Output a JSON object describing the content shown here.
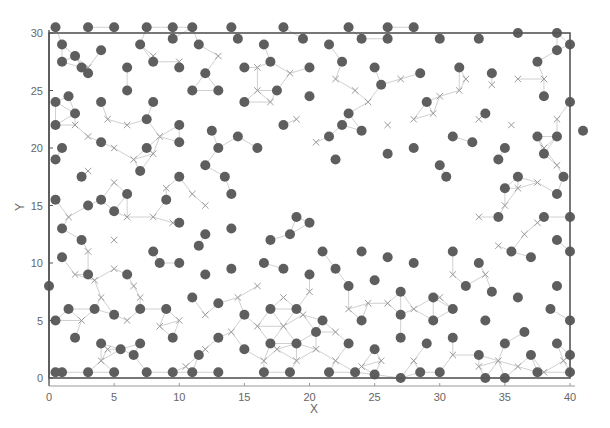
{
  "chart_data": {
    "type": "scatter",
    "title": "",
    "xlabel": "X",
    "ylabel": "Y",
    "xlim": [
      0,
      40
    ],
    "ylim": [
      0,
      30
    ],
    "xticks": [
      0,
      5,
      10,
      15,
      20,
      25,
      30,
      35,
      40
    ],
    "yticks": [
      0,
      5,
      10,
      15,
      20,
      25,
      30
    ],
    "grid": false,
    "legend": null,
    "colors": {
      "node": "#5e5e5e",
      "cross": "#9a9a9a",
      "edge": "#c4c4c4",
      "frame": "#555555",
      "text": "#666666"
    },
    "series": [
      {
        "name": "nodes (filled circles)",
        "marker": "circle",
        "points": [
          [
            0.5,
            30.5
          ],
          [
            3,
            30.5
          ],
          [
            5,
            30.5
          ],
          [
            7.5,
            30.5
          ],
          [
            9.5,
            30.5
          ],
          [
            11,
            30.5
          ],
          [
            14,
            30.5
          ],
          [
            18,
            30.5
          ],
          [
            23,
            30.5
          ],
          [
            26,
            30.5
          ],
          [
            28,
            30.5
          ],
          [
            1,
            29
          ],
          [
            4,
            28.5
          ],
          [
            7,
            29
          ],
          [
            9.5,
            29.5
          ],
          [
            11.5,
            29
          ],
          [
            14.5,
            29.5
          ],
          [
            16.5,
            29
          ],
          [
            19.5,
            29.5
          ],
          [
            21.5,
            29
          ],
          [
            24,
            29.5
          ],
          [
            26,
            29.5
          ],
          [
            30,
            29.5
          ],
          [
            33,
            29.5
          ],
          [
            36,
            30
          ],
          [
            39,
            30
          ],
          [
            40,
            29
          ],
          [
            1,
            27.5
          ],
          [
            2,
            28
          ],
          [
            2.5,
            27
          ],
          [
            3,
            26.5
          ],
          [
            6,
            27
          ],
          [
            8,
            27.5
          ],
          [
            10,
            27
          ],
          [
            12,
            26.5
          ],
          [
            15,
            27
          ],
          [
            17,
            27.5
          ],
          [
            20,
            27
          ],
          [
            22.5,
            27.5
          ],
          [
            25,
            27
          ],
          [
            28.5,
            26.5
          ],
          [
            31.5,
            27
          ],
          [
            34,
            26.5
          ],
          [
            37.5,
            27.5
          ],
          [
            39,
            28.5
          ],
          [
            0.5,
            24
          ],
          [
            1.5,
            24.5
          ],
          [
            4,
            24
          ],
          [
            6,
            25
          ],
          [
            8,
            24
          ],
          [
            11,
            25
          ],
          [
            13,
            25
          ],
          [
            15,
            24
          ],
          [
            17.5,
            25
          ],
          [
            20,
            24.5
          ],
          [
            23,
            23
          ],
          [
            25.5,
            25.5
          ],
          [
            29,
            24
          ],
          [
            33.5,
            23
          ],
          [
            38,
            24.5
          ],
          [
            40,
            24
          ],
          [
            2,
            23
          ],
          [
            7.5,
            22.5
          ],
          [
            10,
            22
          ],
          [
            12.5,
            21.5
          ],
          [
            14.5,
            21
          ],
          [
            18,
            22
          ],
          [
            21.5,
            21
          ],
          [
            22.5,
            22
          ],
          [
            24,
            21.5
          ],
          [
            28,
            20
          ],
          [
            31,
            21
          ],
          [
            32.5,
            20.5
          ],
          [
            35,
            20
          ],
          [
            37.5,
            21
          ],
          [
            39,
            21
          ],
          [
            41,
            21.5
          ],
          [
            0.5,
            22
          ],
          [
            1,
            20
          ],
          [
            4,
            20.5
          ],
          [
            7.5,
            20
          ],
          [
            10,
            20.5
          ],
          [
            13,
            20
          ],
          [
            16,
            20
          ],
          [
            22,
            19
          ],
          [
            26,
            19.5
          ],
          [
            30,
            18.5
          ],
          [
            34.5,
            19
          ],
          [
            38,
            19.5
          ],
          [
            0.5,
            19
          ],
          [
            2.5,
            17.5
          ],
          [
            7,
            18
          ],
          [
            10,
            17.5
          ],
          [
            12,
            18.5
          ],
          [
            13.5,
            17.5
          ],
          [
            30.5,
            17.5
          ],
          [
            36,
            17.5
          ],
          [
            39.5,
            17.5
          ],
          [
            4,
            15.5
          ],
          [
            6,
            16
          ],
          [
            9,
            15.5
          ],
          [
            14,
            16
          ],
          [
            35,
            16.5
          ],
          [
            39,
            16
          ],
          [
            0.5,
            15.5
          ],
          [
            3,
            15
          ],
          [
            5,
            14.5
          ],
          [
            10,
            13.5
          ],
          [
            12,
            12.5
          ],
          [
            14,
            13
          ],
          [
            34.5,
            14
          ],
          [
            38,
            14
          ],
          [
            40,
            14
          ],
          [
            1,
            13
          ],
          [
            2.5,
            12
          ],
          [
            8,
            11
          ],
          [
            11.5,
            11.5
          ],
          [
            17,
            12
          ],
          [
            18.5,
            12.5
          ],
          [
            19,
            14
          ],
          [
            20,
            13.5
          ],
          [
            21,
            11
          ],
          [
            22,
            9.5
          ],
          [
            24,
            11
          ],
          [
            26,
            10.5
          ],
          [
            28,
            10
          ],
          [
            31,
            11
          ],
          [
            33,
            10
          ],
          [
            35.5,
            11
          ],
          [
            37,
            10.5
          ],
          [
            39,
            12
          ],
          [
            40,
            11
          ],
          [
            1,
            10.5
          ],
          [
            3,
            9
          ],
          [
            6,
            9
          ],
          [
            8.5,
            10
          ],
          [
            10,
            10
          ],
          [
            12,
            9
          ],
          [
            14,
            9.5
          ],
          [
            16.5,
            10
          ],
          [
            18,
            9.5
          ],
          [
            20,
            9
          ],
          [
            23,
            8
          ],
          [
            25,
            8.5
          ],
          [
            27,
            7.5
          ],
          [
            29.5,
            7
          ],
          [
            32,
            8
          ],
          [
            34,
            7.5
          ],
          [
            36,
            7
          ],
          [
            39,
            8
          ],
          [
            0,
            8
          ],
          [
            1.5,
            6
          ],
          [
            3.5,
            6
          ],
          [
            5,
            5.5
          ],
          [
            7,
            6
          ],
          [
            9,
            6
          ],
          [
            11,
            7
          ],
          [
            13,
            6.5
          ],
          [
            15,
            5.5
          ],
          [
            17,
            6
          ],
          [
            19,
            6
          ],
          [
            21,
            5
          ],
          [
            24,
            5
          ],
          [
            27,
            5.5
          ],
          [
            29.5,
            5
          ],
          [
            31,
            6
          ],
          [
            33.5,
            5
          ],
          [
            36.5,
            4
          ],
          [
            38.5,
            6
          ],
          [
            40,
            5
          ],
          [
            0.5,
            5
          ],
          [
            2,
            3.5
          ],
          [
            4,
            3
          ],
          [
            5.5,
            2.5
          ],
          [
            6.5,
            2
          ],
          [
            7,
            3
          ],
          [
            9.5,
            3.5
          ],
          [
            11.5,
            2
          ],
          [
            13,
            3.5
          ],
          [
            15,
            2.5
          ],
          [
            17,
            3
          ],
          [
            19,
            3
          ],
          [
            20.5,
            4
          ],
          [
            23,
            3
          ],
          [
            25,
            2.5
          ],
          [
            27,
            3.5
          ],
          [
            29,
            3
          ],
          [
            31,
            3.5
          ],
          [
            33,
            2
          ],
          [
            35,
            3
          ],
          [
            37,
            2
          ],
          [
            39,
            3
          ],
          [
            40,
            2
          ],
          [
            0.5,
            0.5
          ],
          [
            1,
            0.5
          ],
          [
            3,
            0.5
          ],
          [
            5,
            0.5
          ],
          [
            7.5,
            0.5
          ],
          [
            9.5,
            0.5
          ],
          [
            11,
            0.5
          ],
          [
            13,
            0.5
          ],
          [
            16.5,
            0.5
          ],
          [
            18.5,
            0.5
          ],
          [
            21.5,
            0.5
          ],
          [
            23.5,
            0.5
          ],
          [
            25,
            0.3
          ],
          [
            27,
            0
          ],
          [
            28.5,
            0.5
          ],
          [
            30,
            0.5
          ],
          [
            33.5,
            0
          ],
          [
            35,
            0
          ],
          [
            37.5,
            0.5
          ],
          [
            40,
            0.5
          ]
        ]
      },
      {
        "name": "crosses (x markers)",
        "marker": "x",
        "points": [
          [
            3,
            27
          ],
          [
            8,
            28
          ],
          [
            10,
            27.5
          ],
          [
            13,
            28
          ],
          [
            16,
            27
          ],
          [
            18.5,
            26.5
          ],
          [
            27,
            26
          ],
          [
            32,
            26
          ],
          [
            34,
            25.5
          ],
          [
            36,
            26
          ],
          [
            38,
            26
          ],
          [
            2,
            22
          ],
          [
            3,
            21
          ],
          [
            4.5,
            22.5
          ],
          [
            6,
            22
          ],
          [
            8.5,
            21
          ],
          [
            5,
            20
          ],
          [
            6.5,
            19
          ],
          [
            8,
            19.5
          ],
          [
            3,
            18
          ],
          [
            5,
            17
          ],
          [
            9,
            16.5
          ],
          [
            11,
            16
          ],
          [
            12,
            15
          ],
          [
            8,
            14
          ],
          [
            9.5,
            13.5
          ],
          [
            6,
            14
          ],
          [
            1.5,
            14
          ],
          [
            5,
            12
          ],
          [
            3,
            11
          ],
          [
            2,
            9
          ],
          [
            3.5,
            8.5
          ],
          [
            5,
            9.5
          ],
          [
            6.5,
            8
          ],
          [
            7,
            7
          ],
          [
            4,
            7
          ],
          [
            2.5,
            5
          ],
          [
            6,
            5
          ],
          [
            8.5,
            4.5
          ],
          [
            10,
            5
          ],
          [
            12,
            5.5
          ],
          [
            14,
            4
          ],
          [
            16,
            4.5
          ],
          [
            18,
            4.5
          ],
          [
            19.5,
            5.5
          ],
          [
            22,
            4
          ],
          [
            23,
            6
          ],
          [
            24.5,
            6.5
          ],
          [
            26,
            6.5
          ],
          [
            28,
            6
          ],
          [
            30,
            7
          ],
          [
            31,
            9
          ],
          [
            33.5,
            9
          ],
          [
            34.5,
            11.5
          ],
          [
            36.5,
            12.5
          ],
          [
            37.5,
            13.5
          ],
          [
            33,
            14
          ],
          [
            35,
            15
          ],
          [
            36,
            16.5
          ],
          [
            37.5,
            17
          ],
          [
            39,
            18.5
          ],
          [
            38,
            20
          ],
          [
            24.5,
            24
          ],
          [
            26,
            22
          ],
          [
            28,
            22.5
          ],
          [
            29.5,
            23
          ],
          [
            30,
            24.5
          ],
          [
            31.5,
            25
          ],
          [
            33,
            22.5
          ],
          [
            35.5,
            22
          ],
          [
            39,
            22.5
          ],
          [
            19,
            22.5
          ],
          [
            20.5,
            20.5
          ],
          [
            16,
            25
          ],
          [
            17,
            24
          ],
          [
            22,
            26
          ],
          [
            23.5,
            25
          ],
          [
            4,
            1.5
          ],
          [
            4.5,
            2.5
          ],
          [
            10.5,
            1
          ],
          [
            12,
            2.5
          ],
          [
            16.5,
            1.5
          ],
          [
            17.5,
            2.5
          ],
          [
            19,
            1.5
          ],
          [
            20.5,
            2.5
          ],
          [
            22,
            1.5
          ],
          [
            24,
            1
          ],
          [
            25.5,
            1.5
          ],
          [
            28,
            1.5
          ],
          [
            31,
            2
          ],
          [
            33,
            1
          ],
          [
            34.5,
            1.5
          ],
          [
            36,
            1
          ],
          [
            38,
            0.5
          ],
          [
            39.5,
            1.5
          ],
          [
            14.5,
            7
          ],
          [
            16,
            8
          ],
          [
            18,
            7
          ],
          [
            20,
            7.5
          ]
        ]
      }
    ]
  },
  "axes": {
    "xlabel": "X",
    "ylabel": "Y",
    "xtick_labels": [
      "0",
      "5",
      "10",
      "15",
      "20",
      "25",
      "30",
      "35",
      "40"
    ],
    "ytick_labels": [
      "0",
      "5",
      "10",
      "15",
      "20",
      "25",
      "30"
    ]
  }
}
